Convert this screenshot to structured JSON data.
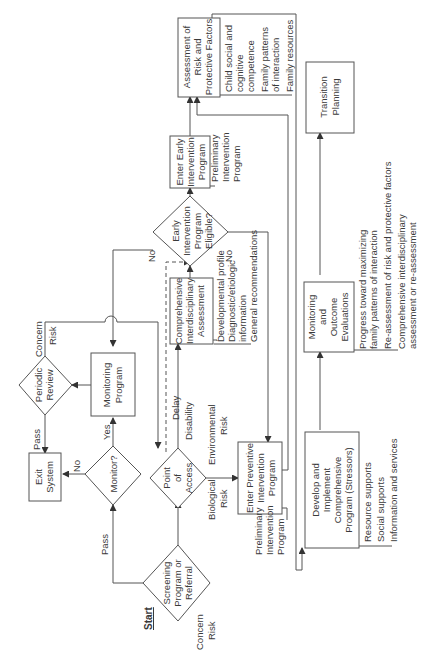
{
  "diagram": {
    "type": "flowchart",
    "orientation": "rotated-90-counterclockwise",
    "start_label": "Start",
    "nodes": {
      "screening": {
        "shape": "diamond",
        "lines": [
          "Screening",
          "Program or",
          "Referral"
        ]
      },
      "point_of_access": {
        "shape": "diamond",
        "lines": [
          "Point",
          "of",
          "Access"
        ]
      },
      "monitor_decision": {
        "shape": "diamond",
        "lines": [
          "Monitor?"
        ]
      },
      "exit_system": {
        "shape": "box",
        "lines": [
          "Exit",
          "System"
        ]
      },
      "periodic_review": {
        "shape": "diamond",
        "lines": [
          "Periodic",
          "Review"
        ]
      },
      "monitoring_program": {
        "shape": "box",
        "lines": [
          "Monitoring",
          "Program"
        ]
      },
      "comprehensive_assessment": {
        "shape": "box",
        "lines": [
          "Comprehensive",
          "Interdisciplinary",
          "Assessment"
        ]
      },
      "ei_eligible": {
        "shape": "diamond",
        "lines": [
          "Early",
          "Intervention",
          "Program",
          "Eligible?"
        ]
      },
      "enter_early_intervention": {
        "shape": "box",
        "lines": [
          "Enter Early",
          "Intervention",
          "Program"
        ]
      },
      "assessment_risk": {
        "shape": "box",
        "lines": [
          "Assessment of",
          "Risk and",
          "Protective Factors"
        ]
      },
      "enter_preventive": {
        "shape": "box",
        "lines": [
          "Enter Preventive",
          "Intervention",
          "Program"
        ]
      },
      "develop_implement": {
        "shape": "box",
        "lines": [
          "Develop and",
          "Implement",
          "Comprehensive",
          "Program (Stressors)"
        ]
      },
      "monitoring_outcome": {
        "shape": "box",
        "lines": [
          "Monitoring",
          "and",
          "Outcome",
          "Evaluations"
        ]
      },
      "transition_planning": {
        "shape": "box",
        "lines": [
          "Transition",
          "Planning"
        ]
      }
    },
    "edge_labels": {
      "screening_concern": "Concern",
      "screening_risk": "Risk",
      "screening_pass": "Pass",
      "monitor_yes": "Yes",
      "monitor_no": "No",
      "review_pass": "Pass",
      "review_concern": "Concern",
      "review_risk": "Risk",
      "poa_biological": "Biological",
      "poa_biological_2": "Risk",
      "poa_environmental": "Environmental",
      "poa_environmental_2": "Risk",
      "poa_delay": "Delay",
      "poa_disability": "Disability",
      "ei_yes": "Yes",
      "ei_no_top": "No",
      "ei_no_bottom": "No"
    },
    "annotations": {
      "comprehensive_assessment": [
        "Developmental profile",
        "Diagnostic/etiologic",
        "information",
        "General recommendations"
      ],
      "enter_early_intervention": [
        "Preliminary",
        "Intervention",
        "Program"
      ],
      "assessment_risk": [
        "Child social and",
        "cognitive",
        "competence",
        "Family patterns",
        "of interaction",
        "Family resources"
      ],
      "enter_preventive": [
        "Preliminary",
        "Intervention",
        "Program"
      ],
      "develop_implement": [
        "Resource supports",
        "Social supports",
        "Information and services"
      ],
      "monitoring_outcome": [
        "Progress toward maximizing",
        "family patterns of interaction",
        "Re-assessment of risk and protective factors",
        "Comprehensive interdisciplinary",
        "assessment or re-assessment"
      ]
    }
  }
}
